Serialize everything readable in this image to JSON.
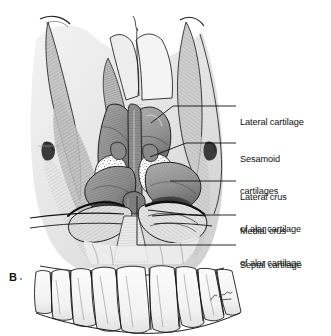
{
  "figure": {
    "panel_letter": "B",
    "artist_signature": "N. Joy",
    "style": "grayscale pen-and-ink medical illustration",
    "background_color": "#ffffff",
    "ink_color": "#111111",
    "cartilage_gray": "#9a9a9a",
    "bone_gray": "#d8d8d8",
    "shadow_gray": "#6a6a6a"
  },
  "labels": [
    {
      "id": "lateral-cartilage",
      "lines": [
        "Lateral cartilage"
      ],
      "text_x": 240,
      "text_y": 101,
      "leader": {
        "x1": 227,
        "y1": 106,
        "x2": 152,
        "y2": 106,
        "x3": 133,
        "y3": 126
      }
    },
    {
      "id": "sesamoid-cartilages",
      "lines": [
        "Sesamoid",
        "cartilages"
      ],
      "text_x": 240,
      "text_y": 138,
      "leader": {
        "x1": 227,
        "y1": 143,
        "x2": 175,
        "y2": 143,
        "x3": 143,
        "y3": 158
      }
    },
    {
      "id": "lateral-crus-of-alar-cartilage",
      "lines": [
        "Lateral crus",
        "of alar cartilage"
      ],
      "text_x": 240,
      "text_y": 176,
      "leader": {
        "x1": 227,
        "y1": 181,
        "x2": 168,
        "y2": 181,
        "x3": 168,
        "y3": 181
      }
    },
    {
      "id": "medial-crus-of-alar-cartilage",
      "lines": [
        "Medial crus",
        "of alar cartilage"
      ],
      "text_x": 240,
      "text_y": 210,
      "leader": {
        "x1": 227,
        "y1": 215,
        "x2": 148,
        "y2": 211,
        "x3": 148,
        "y3": 211
      }
    },
    {
      "id": "septal-cartilage",
      "lines": [
        "Septal cartilage"
      ],
      "text_x": 240,
      "text_y": 240,
      "leader": {
        "x1": 227,
        "y1": 245,
        "x2": 137,
        "y2": 245,
        "x3": 137,
        "y3": 196
      }
    }
  ]
}
